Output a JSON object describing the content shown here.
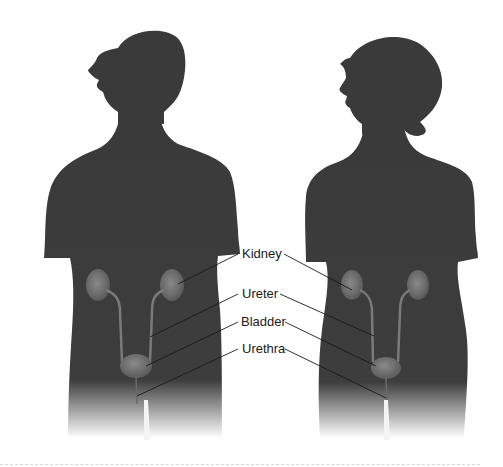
{
  "diagram": {
    "figures": [
      {
        "id": "male",
        "name": "male-silhouette"
      },
      {
        "id": "female",
        "name": "female-silhouette"
      }
    ],
    "labels": [
      {
        "id": "kidney",
        "text": "Kidney"
      },
      {
        "id": "ureter",
        "text": "Ureter"
      },
      {
        "id": "bladder",
        "text": "Bladder"
      },
      {
        "id": "urethra",
        "text": "Urethra"
      }
    ],
    "colors": {
      "silhouette": "#3a3a3a",
      "organ": "#6e6e6e",
      "organ_highlight": "#8a8a8a",
      "leader_line": "#1a1a1a",
      "background": "#ffffff"
    }
  }
}
